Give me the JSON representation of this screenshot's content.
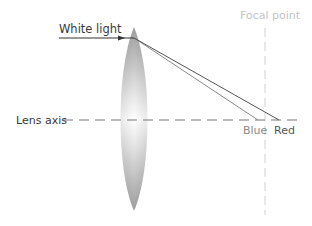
{
  "diagram": {
    "type": "lens chromatic aberration",
    "labels": {
      "white_light": "White light",
      "focal_point": "Focal point",
      "lens_axis": "Lens axis",
      "blue": "Blue",
      "red": "Red"
    },
    "colors": {
      "ray": "#555555",
      "blue_ray": "#8a8a8a",
      "axis": "#777777",
      "focal_line": "#e6e6e6",
      "lens_edge": "#bdbdbd",
      "lens_center": "#ffffff"
    }
  }
}
